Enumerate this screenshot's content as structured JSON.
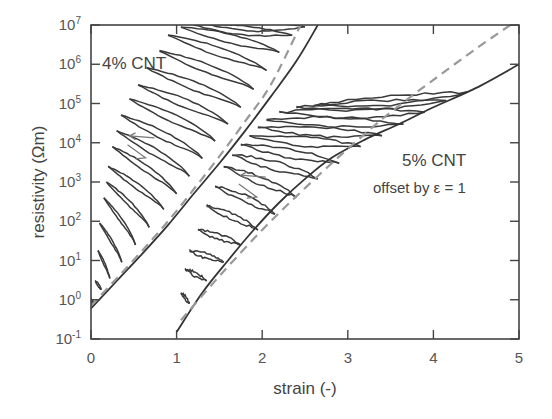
{
  "chart_data": {
    "type": "line",
    "title": "",
    "xlabel": "strain (-)",
    "ylabel": "resistivity (Ωm)",
    "xlim": [
      0,
      5
    ],
    "ylim": [
      0.1,
      10000000
    ],
    "yscale": "log",
    "grid": false,
    "x_ticks": [
      "0",
      "1",
      "2",
      "3",
      "4",
      "5"
    ],
    "y_ticks": [
      {
        "base": "10",
        "exp": "-1"
      },
      {
        "base": "10",
        "exp": "0"
      },
      {
        "base": "10",
        "exp": "1"
      },
      {
        "base": "10",
        "exp": "2"
      },
      {
        "base": "10",
        "exp": "3"
      },
      {
        "base": "10",
        "exp": "4"
      },
      {
        "base": "10",
        "exp": "5"
      },
      {
        "base": "10",
        "exp": "6"
      },
      {
        "base": "10",
        "exp": "7"
      }
    ],
    "annotations": [
      {
        "text": "4% CNT",
        "x": 0.1,
        "y": 1000000
      },
      {
        "text": "5% CNT",
        "x": 3.3,
        "y": 2500
      },
      {
        "text": "offset by ε = 1",
        "x": 3.05,
        "y": 600
      }
    ],
    "series": [
      {
        "name": "4% CNT loading envelope",
        "style": "solid",
        "color": "#333333",
        "x": [
          0.0,
          0.3,
          0.6,
          0.9,
          1.2,
          1.5,
          1.8,
          2.1,
          2.4,
          2.65
        ],
        "y": [
          0.6,
          3,
          15,
          80,
          500,
          3000,
          20000,
          150000,
          1200000,
          10000000
        ]
      },
      {
        "name": "4% CNT model fit",
        "style": "dashed",
        "color": "#999999",
        "x": [
          0.0,
          0.3,
          0.6,
          0.9,
          1.2,
          1.5,
          1.8,
          2.1,
          2.45
        ],
        "y": [
          0.7,
          3.5,
          18,
          100,
          650,
          4500,
          35000,
          300000,
          10000000
        ]
      },
      {
        "name": "5% CNT loading envelope (offset by 1)",
        "style": "solid",
        "color": "#333333",
        "x": [
          1.0,
          1.3,
          1.6,
          1.9,
          2.2,
          2.5,
          2.8,
          3.2,
          3.6,
          4.0,
          4.5,
          5.0
        ],
        "y": [
          0.15,
          1.5,
          10,
          60,
          300,
          1200,
          4000,
          12000,
          30000,
          80000,
          250000,
          1000000
        ]
      },
      {
        "name": "5% CNT model fit (offset by 1)",
        "style": "dashed",
        "color": "#999999",
        "x": [
          1.05,
          1.5,
          2.0,
          2.5,
          3.0,
          3.5,
          4.0,
          4.5,
          4.9
        ],
        "y": [
          0.3,
          4,
          60,
          700,
          7000,
          60000,
          400000,
          2500000,
          10000000
        ]
      }
    ],
    "unloading_cycles": {
      "4% CNT": {
        "start_strain": [
          0.03,
          0.12,
          0.22,
          0.36,
          0.52,
          0.68,
          0.85,
          1.0,
          1.15,
          1.3,
          1.45,
          1.6,
          1.75,
          1.9,
          2.05,
          2.2,
          2.35,
          2.5
        ],
        "start_rho": [
          0.8,
          1.8,
          3.5,
          9,
          25,
          70,
          200,
          500,
          1400,
          4000,
          11000,
          30000,
          80000,
          230000,
          700000,
          2000000,
          5500000,
          9000000
        ],
        "end_strain": [
          0.0,
          0.05,
          0.08,
          0.1,
          0.15,
          0.18,
          0.2,
          0.25,
          0.3,
          0.35,
          0.45,
          0.55,
          0.65,
          0.8,
          0.9,
          1.05,
          1.2,
          1.4
        ],
        "end_rho": [
          1.0,
          3.0,
          18,
          90,
          400,
          1000,
          2500,
          8000,
          20000,
          50000,
          130000,
          300000,
          800000,
          2200000,
          5500000,
          9000000,
          10000000,
          10000000
        ]
      },
      "5% CNT": {
        "start_strain": [
          1.15,
          1.35,
          1.55,
          1.75,
          1.95,
          2.15,
          2.4,
          2.65,
          2.9,
          3.15,
          3.4,
          3.65,
          3.9,
          4.15,
          4.4
        ],
        "start_rho": [
          0.8,
          3,
          9,
          25,
          60,
          150,
          400,
          1200,
          3000,
          8000,
          15000,
          30000,
          60000,
          120000,
          200000
        ],
        "end_strain": [
          1.05,
          1.1,
          1.15,
          1.25,
          1.35,
          1.45,
          1.55,
          1.65,
          1.75,
          1.85,
          1.95,
          2.05,
          2.2,
          2.4,
          2.6
        ],
        "end_rho": [
          1.5,
          6,
          18,
          60,
          250,
          800,
          2500,
          5000,
          9000,
          15000,
          25000,
          40000,
          60000,
          80000,
          90000
        ]
      }
    },
    "arrows": [
      {
        "series": "4% CNT",
        "direction": "left",
        "x": 0.45,
        "y": 15000
      },
      {
        "series": "5% CNT",
        "direction": "left",
        "x": 1.75,
        "y": 1500
      }
    ]
  }
}
